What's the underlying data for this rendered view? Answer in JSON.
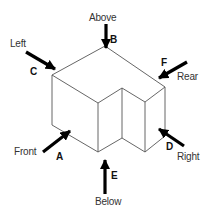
{
  "diagram": {
    "type": "isometric-view-directions",
    "shape": "L-shaped block with notch",
    "colors": {
      "line": "#555555",
      "arrow": "#000000",
      "text": "#333333",
      "letter": "#111111",
      "background": "#ffffff"
    },
    "views": [
      {
        "letter": "A",
        "label": "Front"
      },
      {
        "letter": "B",
        "label": "Above"
      },
      {
        "letter": "C",
        "label": "Left"
      },
      {
        "letter": "D",
        "label": "Right"
      },
      {
        "letter": "E",
        "label": "Below"
      },
      {
        "letter": "F",
        "label": "Rear"
      }
    ]
  }
}
